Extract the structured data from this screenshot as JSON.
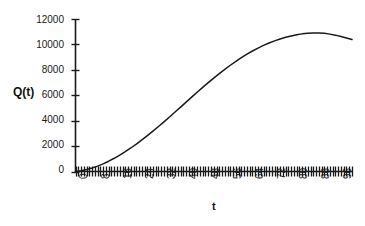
{
  "chart_data": {
    "type": "line",
    "title": "",
    "xlabel": "t",
    "ylabel": "Q(t)",
    "xlim": [
      0,
      100
    ],
    "ylim": [
      0,
      12000
    ],
    "grid": false,
    "legend": null,
    "y_ticks": [
      0,
      2000,
      4000,
      6000,
      8000,
      10000,
      12000
    ],
    "y_tick_labels": [
      "0",
      "2000",
      "4000",
      "6000",
      "8000",
      "10000",
      "12000"
    ],
    "x_ticks": [
      0,
      8,
      16,
      24,
      32,
      40,
      48,
      56,
      64,
      72,
      80,
      88,
      96
    ],
    "x_tick_labels": [
      "0",
      "8",
      "16",
      "24",
      "32",
      "40",
      "48",
      "56",
      "64",
      "72",
      "80",
      "88",
      "96"
    ],
    "x_minor_tick_step": 1,
    "series": [
      {
        "name": "Q(t)",
        "color": "#1a1a1a",
        "x": [
          0,
          2,
          4,
          6,
          8,
          10,
          12,
          14,
          16,
          18,
          20,
          22,
          24,
          26,
          28,
          30,
          32,
          34,
          36,
          38,
          40,
          42,
          44,
          46,
          48,
          50,
          52,
          54,
          56,
          58,
          60,
          62,
          64,
          66,
          68,
          70,
          72,
          74,
          76,
          78,
          80,
          82,
          84,
          86,
          88,
          90,
          92,
          94,
          96,
          98,
          100
        ],
        "values": [
          0,
          60,
          150,
          270,
          420,
          600,
          810,
          1040,
          1290,
          1560,
          1850,
          2160,
          2490,
          2830,
          3180,
          3540,
          3910,
          4290,
          4680,
          5070,
          5460,
          5850,
          6240,
          6620,
          6990,
          7350,
          7700,
          8040,
          8360,
          8670,
          8960,
          9230,
          9480,
          9710,
          9920,
          10110,
          10280,
          10430,
          10560,
          10670,
          10760,
          10830,
          10880,
          10900,
          10900,
          10870,
          10810,
          10730,
          10630,
          10510,
          10390
        ]
      }
    ]
  },
  "axes": {
    "y_axis_label": "Q(t)",
    "x_axis_label": "t"
  }
}
